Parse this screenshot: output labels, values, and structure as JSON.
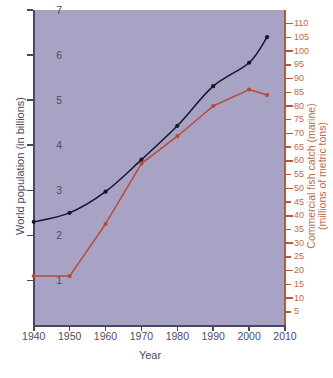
{
  "chart_data": {
    "type": "line",
    "title": "",
    "xlabel": "Year",
    "x": [
      1940,
      1950,
      1960,
      1970,
      1980,
      1990,
      2000,
      2005
    ],
    "xlim": [
      1940,
      2010
    ],
    "xticks": [
      1940,
      1950,
      1960,
      1970,
      1980,
      1990,
      2000,
      2010
    ],
    "grid": false,
    "legend": "none",
    "series": [
      {
        "name": "World population (in billions)",
        "axis": "left",
        "color": "#15152e",
        "x": [
          1940,
          1950,
          1960,
          1970,
          1980,
          1990,
          2000,
          2005
        ],
        "values": [
          2.3,
          2.5,
          2.97,
          3.68,
          4.43,
          5.31,
          5.83,
          6.4
        ]
      },
      {
        "name": "Commercial fish catch (marine) (millions of metric tons)",
        "axis": "right",
        "color": "#ba4a32",
        "x": [
          1940,
          1950,
          1960,
          1970,
          1980,
          1990,
          2000,
          2005
        ],
        "values": [
          18,
          18,
          37,
          59,
          69,
          80,
          86,
          84
        ]
      }
    ],
    "left_axis": {
      "label": "World population (in billions)",
      "ylim": [
        0,
        7
      ],
      "yticks": [
        1,
        2,
        3,
        4,
        5,
        6,
        7
      ],
      "ytick_labels": [
        "1",
        "2",
        "3",
        "4",
        "5",
        "6",
        "7"
      ],
      "color": "#4f4b62"
    },
    "right_axis": {
      "label_line1": "Commercial fish catch (marine)",
      "label_line2": "(millions of metric tons)",
      "ylim": [
        0,
        115
      ],
      "yticks": [
        5,
        10,
        15,
        20,
        25,
        30,
        35,
        40,
        45,
        50,
        55,
        60,
        65,
        70,
        75,
        80,
        85,
        90,
        95,
        100,
        105,
        110
      ],
      "ytick_labels": [
        "5",
        "10",
        "15",
        "20",
        "25",
        "30",
        "35",
        "40",
        "45",
        "50",
        "55",
        "60",
        "65",
        "70",
        "75",
        "80",
        "85",
        "90",
        "95",
        "100",
        "105",
        "110"
      ],
      "color": "#b86a4e"
    },
    "plot_background": "#a8a3c4"
  }
}
